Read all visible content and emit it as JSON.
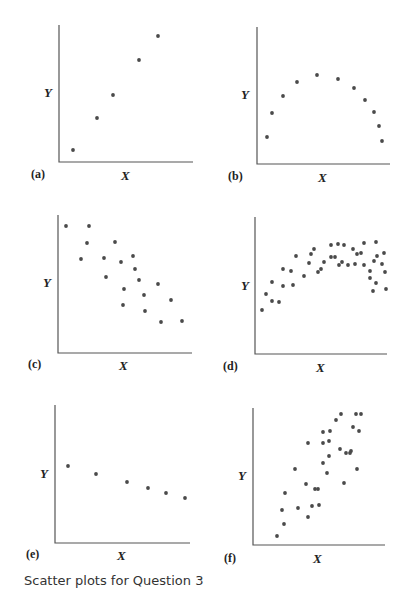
{
  "caption": "Scatter plots for Question 3",
  "colors": {
    "dot": "#4a4a4a",
    "axis": "#555555",
    "text": "#222222"
  },
  "chart_data": [
    {
      "type": "scatter",
      "panel": "(a)",
      "xlabel": "X",
      "ylabel": "Y",
      "title": "",
      "description": "strong positive linear",
      "axis": {
        "x0": 59,
        "y0": 162,
        "x1": 193,
        "ytop": 25
      },
      "labels": {
        "y": [
          44,
          97
        ],
        "x": [
          121,
          180
        ],
        "panel": [
          31,
          178
        ]
      },
      "points": [
        [
          73,
          150
        ],
        [
          97,
          118
        ],
        [
          113,
          95
        ],
        [
          139,
          60
        ],
        [
          158,
          36
        ]
      ]
    },
    {
      "type": "scatter",
      "panel": "(b)",
      "xlabel": "X",
      "ylabel": "Y",
      "title": "",
      "description": "curved (inverted U, strong)",
      "axis": {
        "x0": 257,
        "y0": 164,
        "x1": 390,
        "ytop": 27
      },
      "labels": {
        "y": [
          241,
          99
        ],
        "x": [
          318,
          182
        ],
        "panel": [
          228,
          180
        ]
      },
      "points": [
        [
          267,
          137
        ],
        [
          272,
          113
        ],
        [
          283,
          96
        ],
        [
          297,
          82
        ],
        [
          317,
          75
        ],
        [
          338,
          79
        ],
        [
          354,
          88
        ],
        [
          365,
          100
        ],
        [
          374,
          112
        ],
        [
          379,
          126
        ],
        [
          382,
          141
        ]
      ]
    },
    {
      "type": "scatter",
      "panel": "(c)",
      "xlabel": "X",
      "ylabel": "Y",
      "title": "",
      "description": "moderate negative linear",
      "axis": {
        "x0": 58,
        "y0": 353,
        "x1": 192,
        "ytop": 215
      },
      "labels": {
        "y": [
          43,
          287
        ],
        "x": [
          119,
          370
        ],
        "panel": [
          28,
          368
        ]
      },
      "points": [
        [
          66,
          226
        ],
        [
          89,
          226
        ],
        [
          87,
          243
        ],
        [
          115,
          242
        ],
        [
          81,
          259
        ],
        [
          104,
          258
        ],
        [
          121,
          262
        ],
        [
          133,
          256
        ],
        [
          106,
          277
        ],
        [
          135,
          269
        ],
        [
          139,
          280
        ],
        [
          158,
          284
        ],
        [
          124,
          289
        ],
        [
          144,
          295
        ],
        [
          171,
          300
        ],
        [
          123,
          305
        ],
        [
          145,
          311
        ],
        [
          161,
          322
        ],
        [
          182,
          321
        ]
      ]
    },
    {
      "type": "scatter",
      "panel": "(d)",
      "xlabel": "X",
      "ylabel": "Y",
      "title": "",
      "description": "curved (inverted U, moderate scatter)",
      "axis": {
        "x0": 255,
        "y0": 354,
        "x1": 387,
        "ytop": 217
      },
      "labels": {
        "y": [
          241,
          290
        ],
        "x": [
          316,
          372
        ],
        "panel": [
          223,
          370
        ]
      },
      "points": [
        [
          262,
          310
        ],
        [
          266,
          294
        ],
        [
          272,
          282
        ],
        [
          272,
          301
        ],
        [
          283,
          286
        ],
        [
          279,
          302
        ],
        [
          283,
          269
        ],
        [
          291,
          271
        ],
        [
          293,
          285
        ],
        [
          296,
          256
        ],
        [
          304,
          276
        ],
        [
          309,
          263
        ],
        [
          311,
          254
        ],
        [
          314,
          249
        ],
        [
          318,
          272
        ],
        [
          321,
          269
        ],
        [
          324,
          262
        ],
        [
          331,
          257
        ],
        [
          331,
          245
        ],
        [
          335,
          257
        ],
        [
          338,
          244
        ],
        [
          339,
          265
        ],
        [
          342,
          262
        ],
        [
          344,
          245
        ],
        [
          348,
          265
        ],
        [
          353,
          249
        ],
        [
          355,
          264
        ],
        [
          357,
          254
        ],
        [
          361,
          253
        ],
        [
          364,
          265
        ],
        [
          364,
          243
        ],
        [
          370,
          271
        ],
        [
          370,
          278
        ],
        [
          374,
          261
        ],
        [
          377,
          256
        ],
        [
          373,
          291
        ],
        [
          376,
          283
        ],
        [
          382,
          264
        ],
        [
          385,
          272
        ],
        [
          376,
          242
        ],
        [
          384,
          253
        ],
        [
          386,
          289
        ]
      ]
    },
    {
      "type": "scatter",
      "panel": "(e)",
      "xlabel": "X",
      "ylabel": "Y",
      "title": "",
      "description": "weak-slope negative, perfectly linear pattern",
      "axis": {
        "x0": 55,
        "y0": 543,
        "x1": 190,
        "ytop": 405
      },
      "labels": {
        "y": [
          40,
          478
        ],
        "x": [
          117,
          560
        ],
        "panel": [
          26,
          558
        ]
      },
      "points": [
        [
          68,
          466
        ],
        [
          96,
          474
        ],
        [
          127,
          482
        ],
        [
          148,
          488
        ],
        [
          166,
          493
        ],
        [
          185,
          498
        ]
      ]
    },
    {
      "type": "scatter",
      "panel": "(f)",
      "xlabel": "X",
      "ylabel": "Y",
      "title": "",
      "description": "moderate positive linear",
      "axis": {
        "x0": 253,
        "y0": 545,
        "x1": 385,
        "ytop": 408
      },
      "labels": {
        "y": [
          238,
          480
        ],
        "x": [
          313,
          563
        ],
        "panel": [
          224,
          562
        ]
      },
      "points": [
        [
          277,
          536
        ],
        [
          284,
          524
        ],
        [
          282,
          510
        ],
        [
          285,
          493
        ],
        [
          295,
          469
        ],
        [
          298,
          508
        ],
        [
          306,
          484
        ],
        [
          308,
          517
        ],
        [
          315,
          489
        ],
        [
          308,
          443
        ],
        [
          312,
          506
        ],
        [
          323,
          463
        ],
        [
          318,
          489
        ],
        [
          323,
          432
        ],
        [
          319,
          505
        ],
        [
          323,
          443
        ],
        [
          329,
          456
        ],
        [
          329,
          441
        ],
        [
          327,
          473
        ],
        [
          330,
          431
        ],
        [
          336,
          420
        ],
        [
          341,
          414
        ],
        [
          340,
          449
        ],
        [
          344,
          483
        ],
        [
          346,
          453
        ],
        [
          351,
          451
        ],
        [
          353,
          427
        ],
        [
          350,
          453
        ],
        [
          356,
          414
        ],
        [
          357,
          469
        ],
        [
          359,
          431
        ],
        [
          361,
          414
        ]
      ]
    }
  ]
}
